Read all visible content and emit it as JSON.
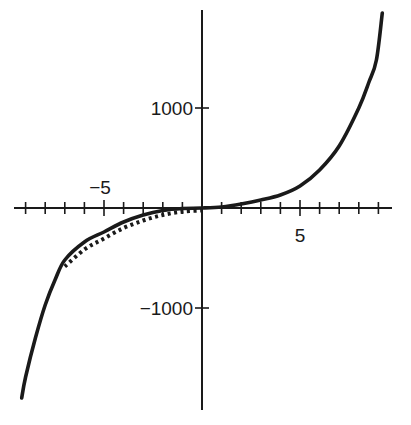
{
  "chart_data": {
    "type": "line",
    "title": "",
    "xlabel": "",
    "ylabel": "",
    "xlim": [
      -10,
      9.5
    ],
    "ylim": [
      -2000,
      2000
    ],
    "grid": false,
    "legend": "none",
    "x_ticks": [
      -9,
      -8,
      -7,
      -6,
      -5,
      -4,
      -3,
      -2,
      -1,
      1,
      2,
      3,
      4,
      5,
      6,
      7,
      8,
      9
    ],
    "x_tick_labels": [
      {
        "value": -5,
        "label": "−5"
      },
      {
        "value": 5,
        "label": "5"
      }
    ],
    "y_ticks": [
      1000,
      -1000
    ],
    "y_tick_labels": [
      {
        "value": 1000,
        "label": "1000"
      },
      {
        "value": -1000,
        "label": "−1000"
      }
    ],
    "series": [
      {
        "name": "solid-curve",
        "style": "solid",
        "color": "#1a1a1a",
        "x": [
          -9.2,
          -9,
          -8.5,
          -8,
          -7.5,
          -7,
          -6,
          -5,
          -4,
          -3,
          -2,
          -1,
          0,
          1,
          2,
          3,
          4,
          5,
          6,
          7,
          8,
          8.5,
          8.9,
          9.2
        ],
        "y": [
          -1900,
          -1690,
          -1300,
          -970,
          -720,
          -520,
          -340,
          -240,
          -140,
          -70,
          -25,
          -5,
          0,
          10,
          40,
          80,
          130,
          220,
          380,
          620,
          1000,
          1250,
          1480,
          1950
        ]
      },
      {
        "name": "dotted-curve",
        "style": "dotted",
        "color": "#1a1a1a",
        "x": [
          -7,
          -6,
          -5,
          -4,
          -3,
          -2,
          -1,
          0
        ],
        "y": [
          -560,
          -390,
          -280,
          -175,
          -100,
          -45,
          -12,
          0
        ]
      }
    ]
  }
}
